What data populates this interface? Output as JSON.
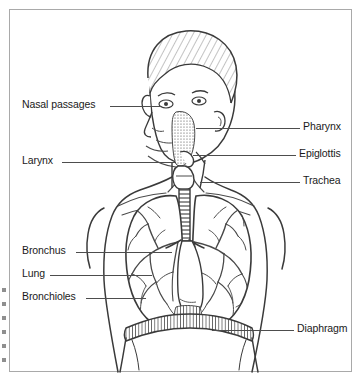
{
  "figure": {
    "background_color": "#ffffff",
    "border_color": "#a9a9a9",
    "line_color": "#3a3a3a",
    "leader_color": "#4d4d4d",
    "text_color": "#1a1a1a"
  },
  "labels": {
    "left": [
      {
        "name": "nasal-passages",
        "text": "Nasal passages",
        "x": 22,
        "y": 101,
        "leader_from_x": 110,
        "leader_to_x": 162,
        "leader_y": 106
      },
      {
        "name": "larynx",
        "text": "Larynx",
        "x": 22,
        "y": 157,
        "leader_from_x": 62,
        "leader_to_x": 176,
        "leader_y": 162
      },
      {
        "name": "bronchus",
        "text": "Bronchus",
        "x": 22,
        "y": 247,
        "leader_from_x": 76,
        "leader_to_x": 172,
        "leader_y": 252
      },
      {
        "name": "lung",
        "text": "Lung",
        "x": 22,
        "y": 270,
        "leader_from_x": 50,
        "leader_to_x": 152,
        "leader_y": 275
      },
      {
        "name": "bronchioles",
        "text": "Bronchioles",
        "x": 22,
        "y": 293,
        "leader_from_x": 86,
        "leader_to_x": 146,
        "leader_y": 298
      }
    ],
    "right": [
      {
        "name": "pharynx",
        "text": "Pharynx",
        "x": 303,
        "y": 123,
        "leader_from_x": 196,
        "leader_to_x": 300,
        "leader_y": 128
      },
      {
        "name": "epiglottis",
        "text": "Epiglottis",
        "x": 299,
        "y": 150,
        "leader_from_x": 193,
        "leader_to_x": 296,
        "leader_y": 155
      },
      {
        "name": "trachea",
        "text": "Trachea",
        "x": 303,
        "y": 177,
        "leader_from_x": 200,
        "leader_to_x": 300,
        "leader_y": 182
      },
      {
        "name": "diaphragm",
        "text": "Diaphragm",
        "x": 297,
        "y": 325,
        "leader_from_x": 212,
        "leader_to_x": 294,
        "leader_y": 330
      }
    ]
  },
  "edge_marks": [
    {
      "y": 288
    },
    {
      "y": 302
    },
    {
      "y": 316
    },
    {
      "y": 330
    },
    {
      "y": 344
    },
    {
      "y": 358
    }
  ]
}
